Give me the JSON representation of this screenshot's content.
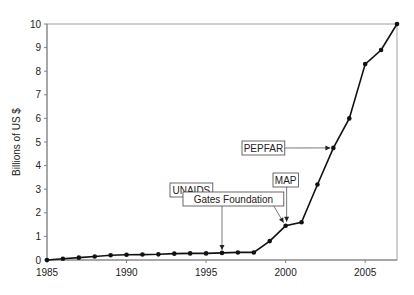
{
  "chart_data": {
    "type": "line",
    "title": "",
    "xlabel": "",
    "ylabel": "Billions of US $",
    "xlim": [
      1985,
      2007
    ],
    "ylim": [
      0,
      10
    ],
    "x_ticks": [
      1985,
      1990,
      1995,
      2000,
      2005
    ],
    "y_ticks": [
      0,
      1,
      2,
      3,
      4,
      5,
      6,
      7,
      8,
      9,
      10
    ],
    "grid": false,
    "legend": null,
    "series": [
      {
        "name": "Funding",
        "x": [
          1985,
          1986,
          1987,
          1988,
          1989,
          1990,
          1991,
          1992,
          1993,
          1994,
          1995,
          1996,
          1997,
          1998,
          1999,
          2000,
          2001,
          2002,
          2003,
          2004,
          2005,
          2006,
          2007
        ],
        "values": [
          0.0,
          0.05,
          0.1,
          0.15,
          0.2,
          0.22,
          0.23,
          0.24,
          0.27,
          0.28,
          0.28,
          0.3,
          0.32,
          0.32,
          0.8,
          1.45,
          1.6,
          3.2,
          4.75,
          6.0,
          8.3,
          8.9,
          10.0
        ]
      }
    ],
    "annotations": [
      {
        "label": "UNAIDS",
        "x": 1996,
        "y": 0.3,
        "box": [
          170,
          183
        ]
      },
      {
        "label": "Gates Foundation",
        "x": 2000,
        "y": 1.45,
        "box": [
          183,
          192
        ]
      },
      {
        "label": "MAP",
        "x": 2000,
        "y": 1.45,
        "box": [
          273,
          173
        ]
      },
      {
        "label": "PEPFAR",
        "x": 2003,
        "y": 4.75,
        "box": [
          242,
          141
        ]
      }
    ]
  }
}
